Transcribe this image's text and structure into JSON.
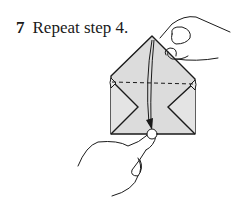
{
  "step": {
    "number": "7",
    "instruction": "Repeat step 4."
  },
  "diagram": {
    "paper_color": "#dcdcdc",
    "line_color": "#1a1a1a",
    "elements": [
      "top-hand-holding-corner",
      "paper-envelope",
      "dashed-fold-line",
      "fold-arrow-down",
      "bottom-hand-pinching-edge"
    ]
  }
}
